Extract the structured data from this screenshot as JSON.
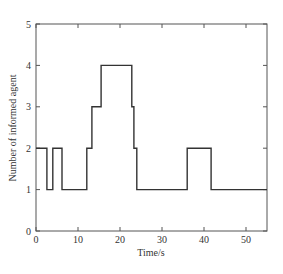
{
  "chart_data": {
    "type": "line",
    "style": "step",
    "title": "",
    "xlabel": "Time/s",
    "ylabel": "Number of informed agent",
    "xlim": [
      0,
      55
    ],
    "ylim": [
      0,
      5
    ],
    "xticks": [
      0,
      10,
      20,
      30,
      40,
      50
    ],
    "yticks": [
      0,
      1,
      2,
      3,
      4,
      5
    ],
    "grid": false,
    "legend": null,
    "series": [
      {
        "name": "informed agents",
        "color": "#333333",
        "x": [
          0,
          2.6,
          2.6,
          4.0,
          4.0,
          6.2,
          6.2,
          12.1,
          12.1,
          13.3,
          13.3,
          15.5,
          15.5,
          22.8,
          22.8,
          23.3,
          23.3,
          24.0,
          24.0,
          36.0,
          36.0,
          41.7,
          41.7,
          55
        ],
        "y": [
          2,
          2,
          1,
          1,
          2,
          2,
          1,
          1,
          2,
          2,
          3,
          3,
          4,
          4,
          3,
          3,
          2,
          2,
          1,
          1,
          2,
          2,
          1,
          1
        ]
      }
    ]
  },
  "labels": {
    "xlabel": "Time/s",
    "ylabel": "Number of informed agent",
    "xticks": [
      "0",
      "10",
      "20",
      "30",
      "40",
      "50"
    ],
    "yticks": [
      "0",
      "1",
      "2",
      "3",
      "4",
      "5"
    ]
  }
}
